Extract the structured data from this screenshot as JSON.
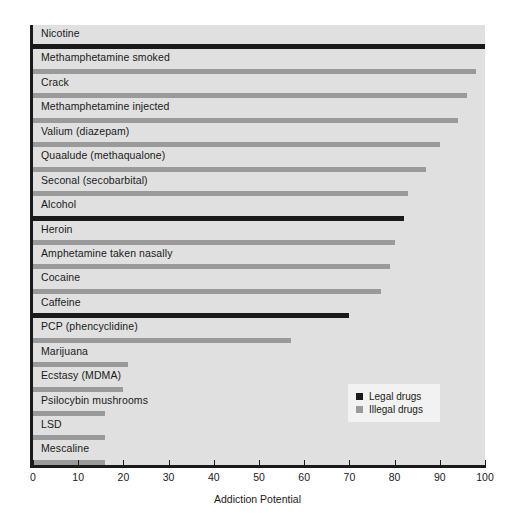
{
  "chart_data": {
    "type": "bar",
    "orientation": "horizontal",
    "title": "",
    "xlabel": "Addiction Potential",
    "ylabel": "",
    "xlim": [
      0,
      100
    ],
    "xticks": [
      0,
      10,
      20,
      30,
      40,
      50,
      60,
      70,
      80,
      90,
      100
    ],
    "grid": false,
    "legend_position": "lower-right",
    "categories": [
      "Nicotine",
      "Methamphetamine smoked",
      "Crack",
      "Methamphetamine injected",
      "Valium (diazepam)",
      "Quaalude (methaqualone)",
      "Seconal (secobarbital)",
      "Alcohol",
      "Heroin",
      "Amphetamine taken nasally",
      "Cocaine",
      "Caffeine",
      "PCP (phencyclidine)",
      "Marijuana",
      "Ecstasy (MDMA)",
      "Psilocybin mushrooms",
      "LSD",
      "Mescaline"
    ],
    "values": [
      100,
      98,
      96,
      94,
      90,
      87,
      83,
      82,
      80,
      79,
      77,
      70,
      57,
      21,
      20,
      16,
      16,
      16
    ],
    "groups": [
      "legal",
      "illegal",
      "illegal",
      "illegal",
      "illegal",
      "illegal",
      "illegal",
      "legal",
      "illegal",
      "illegal",
      "illegal",
      "legal",
      "illegal",
      "illegal",
      "illegal",
      "illegal",
      "illegal",
      "illegal"
    ]
  },
  "legend": {
    "items": [
      {
        "key": "legal",
        "label": "Legal drugs"
      },
      {
        "key": "illegal",
        "label": "Illegal drugs"
      }
    ]
  },
  "colors": {
    "legal": "#1a1a1a",
    "illegal": "#9a9a9a",
    "plot_background": "#e0e0e0",
    "axis": "#1a1a1a",
    "legend_background": "#f2f2f2"
  }
}
